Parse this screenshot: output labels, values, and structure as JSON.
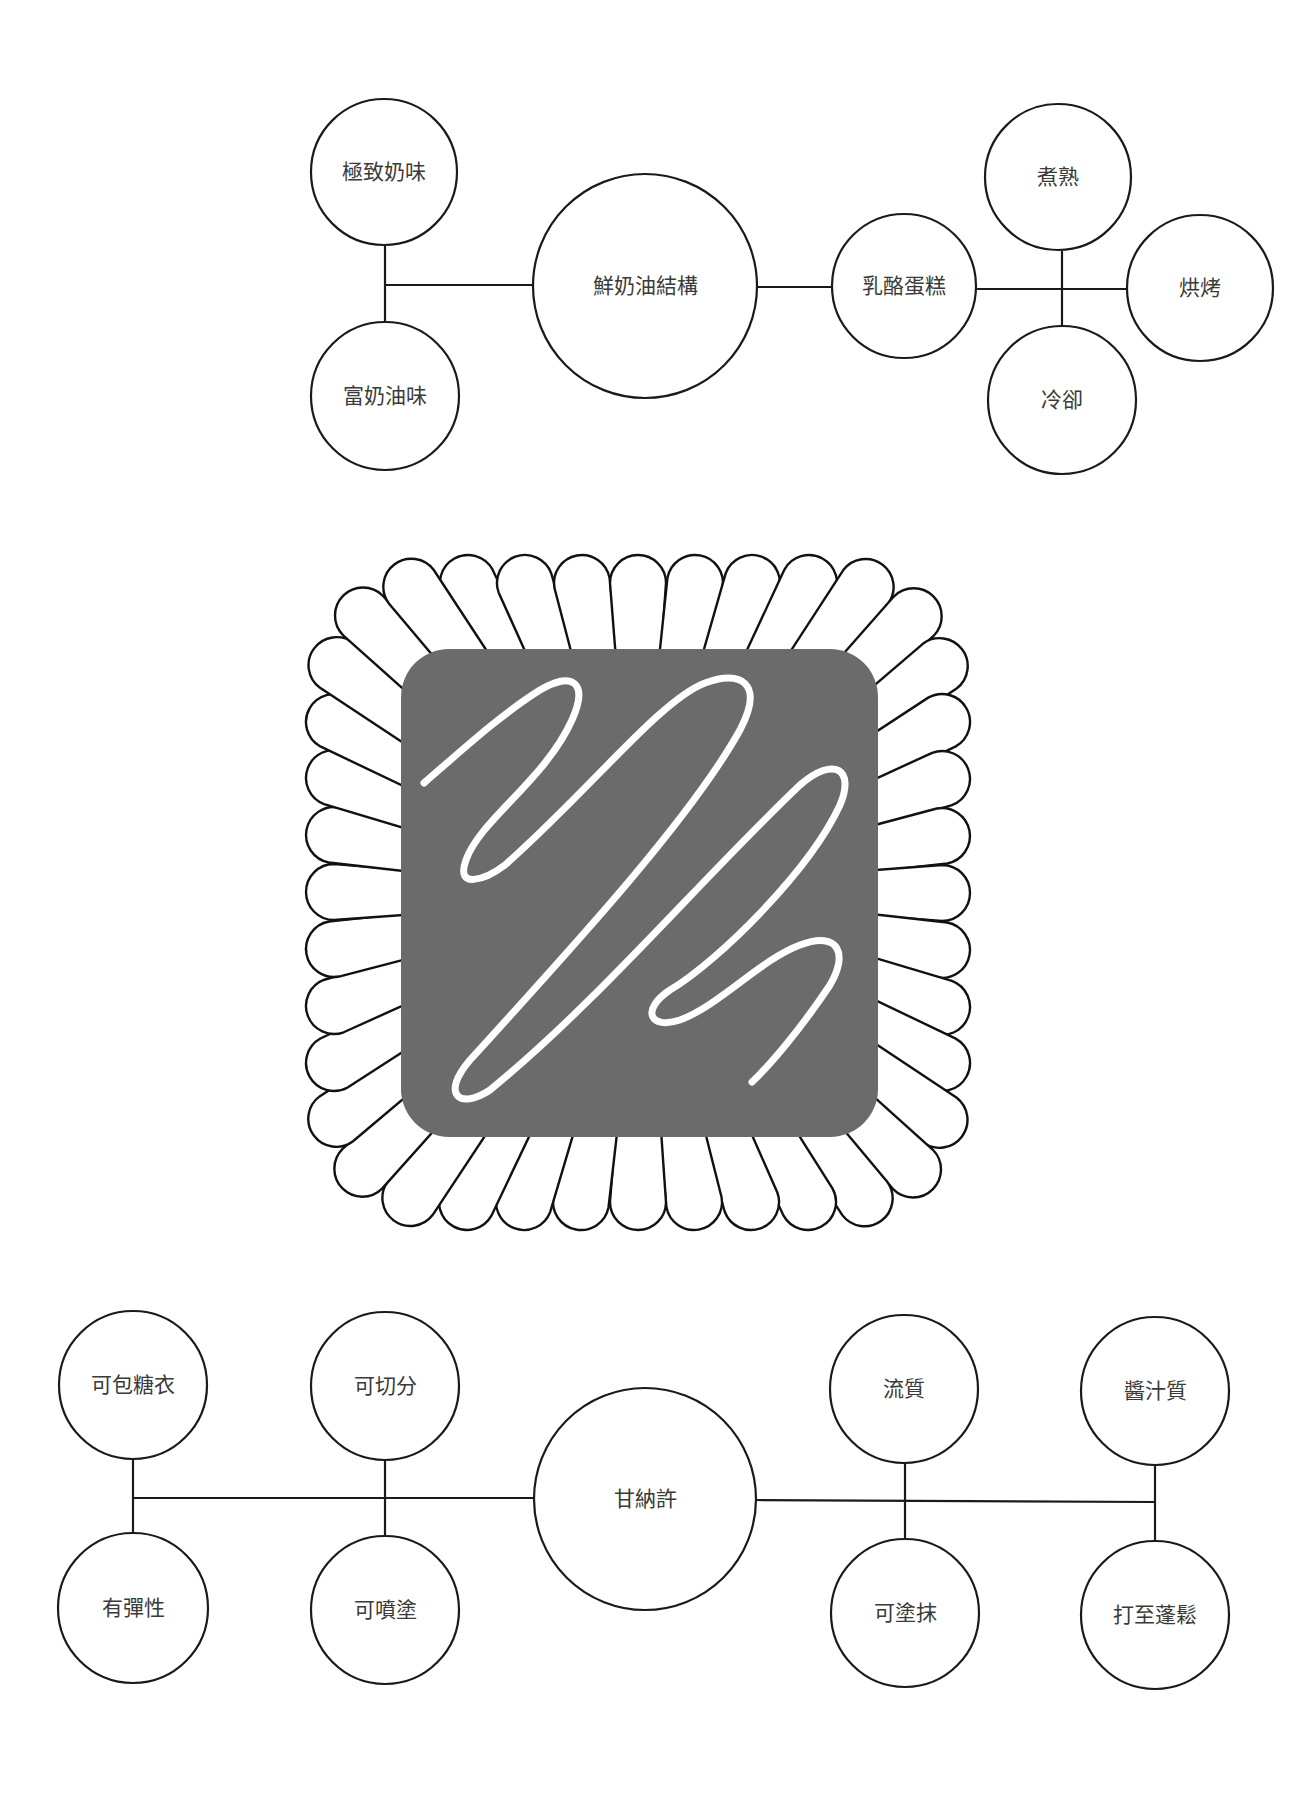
{
  "diagrams": {
    "top": {
      "title": "鮮奶油結構",
      "nodes": [
        {
          "id": "rich_milk",
          "label": "極致奶味",
          "cx": 384,
          "cy": 172,
          "r": 73
        },
        {
          "id": "rich_cream",
          "label": "富奶油味",
          "cx": 385,
          "cy": 396,
          "r": 74
        },
        {
          "id": "cream_structure",
          "label": "鮮奶油結構",
          "cx": 645,
          "cy": 286,
          "r": 112
        },
        {
          "id": "cheesecake",
          "label": "乳酪蛋糕",
          "cx": 904,
          "cy": 286,
          "r": 72
        },
        {
          "id": "cooked",
          "label": "煮熟",
          "cx": 1058,
          "cy": 177,
          "r": 73
        },
        {
          "id": "baked",
          "label": "烘烤",
          "cx": 1200,
          "cy": 288,
          "r": 73
        },
        {
          "id": "cooled",
          "label": "冷卻",
          "cx": 1062,
          "cy": 400,
          "r": 74
        }
      ],
      "edges": [
        [
          385,
          246,
          385,
          322
        ],
        [
          385,
          285,
          533,
          285
        ],
        [
          757,
          287,
          832,
          287
        ],
        [
          976,
          289,
          1127,
          289
        ],
        [
          1062,
          251,
          1062,
          326
        ]
      ]
    },
    "bottom": {
      "title": "甘納許",
      "nodes": [
        {
          "id": "coatable",
          "label": "可包糖衣",
          "cx": 133,
          "cy": 1385,
          "r": 74
        },
        {
          "id": "elastic",
          "label": "有彈性",
          "cx": 133,
          "cy": 1608,
          "r": 75
        },
        {
          "id": "sliceable",
          "label": "可切分",
          "cx": 385,
          "cy": 1386,
          "r": 74
        },
        {
          "id": "sprayable",
          "label": "可噴塗",
          "cx": 385,
          "cy": 1610,
          "r": 74
        },
        {
          "id": "ganache",
          "label": "甘納許",
          "cx": 645,
          "cy": 1499,
          "r": 111
        },
        {
          "id": "fluid",
          "label": "流質",
          "cx": 904,
          "cy": 1389,
          "r": 74
        },
        {
          "id": "spreadable",
          "label": "可塗抹",
          "cx": 905,
          "cy": 1613,
          "r": 74
        },
        {
          "id": "saucy",
          "label": "醬汁質",
          "cx": 1155,
          "cy": 1391,
          "r": 74
        },
        {
          "id": "whippable",
          "label": "打至蓬鬆",
          "cx": 1155,
          "cy": 1615,
          "r": 74
        }
      ],
      "edges": [
        [
          133,
          1459,
          133,
          1534
        ],
        [
          385,
          1460,
          385,
          1536
        ],
        [
          133,
          1498,
          534,
          1498
        ],
        [
          756,
          1500,
          1155,
          1502
        ],
        [
          905,
          1463,
          905,
          1539
        ],
        [
          1155,
          1465,
          1155,
          1541
        ]
      ]
    }
  },
  "illustration": {
    "name": "chocolate-bonbon-in-paper-cup",
    "square": {
      "x": 401,
      "y": 649,
      "w": 477,
      "h": 488,
      "rx": 48,
      "color": "#6b6b6b"
    },
    "cup": {
      "petal_count": 40,
      "outer_x": 334,
      "outer_y": 583,
      "outer_w": 608,
      "outer_h": 619,
      "outer_rx": 105,
      "tip_r": 28
    },
    "swirl_color": "#ffffff"
  }
}
